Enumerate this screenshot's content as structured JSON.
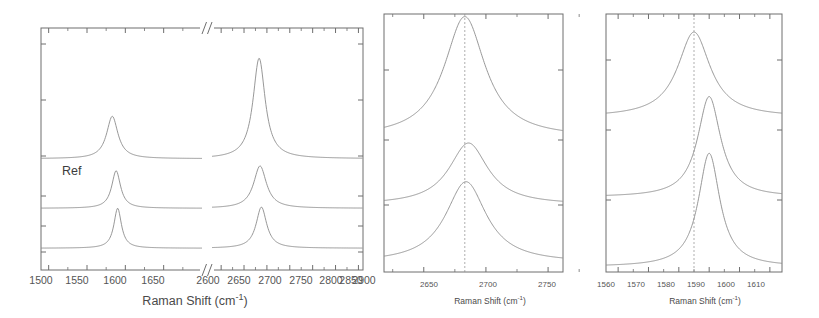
{
  "figure": {
    "background_color": "#ffffff",
    "curve_color": "#8c8c8c",
    "axis_color": "#6e6e6e",
    "text_color": "#4a4a4a",
    "panel_count": 3
  },
  "chart_data": [
    {
      "id": "panel-a",
      "type": "line",
      "title": "",
      "xlabel": "Raman Shift (cm-1)",
      "xlabel_base": "Raman Shift (cm",
      "xlabel_sup": "-1",
      "xlabel_close": ")",
      "ylabel": "",
      "grid": false,
      "legend": "none",
      "axis_break": true,
      "axis_break_symbol": "//",
      "axis_break_position": 2000,
      "xticks": [
        1500,
        1550,
        1600,
        1650,
        2600,
        2650,
        2700,
        2750,
        2800,
        2850,
        2900
      ],
      "xtick_labels": [
        "1500",
        "1550",
        "1600",
        "1650",
        "2600",
        "2650",
        "2700",
        "2750",
        "2800",
        "2850",
        "2900"
      ],
      "xlim_left": [
        1490,
        1700
      ],
      "xlim_right": [
        2580,
        2910
      ],
      "ylim": [
        0,
        1
      ],
      "yticks_visible": true,
      "annotations": [
        {
          "text": "Ref",
          "x": 1545,
          "y": 0.455,
          "name": "ref-label"
        }
      ],
      "series": [
        {
          "name": "Ref (top trace)",
          "offset": 0.46,
          "peaks": [
            {
              "center": 1583,
              "height": 0.175,
              "width": 9,
              "band": "G"
            },
            {
              "center": 2683,
              "height": 0.415,
              "width": 16,
              "band": "2D"
            }
          ]
        },
        {
          "name": "middle trace",
          "offset": 0.255,
          "peaks": [
            {
              "center": 1588,
              "height": 0.155,
              "width": 7,
              "band": "G"
            },
            {
              "center": 2685,
              "height": 0.175,
              "width": 17,
              "band": "2D"
            }
          ]
        },
        {
          "name": "bottom trace",
          "offset": 0.09,
          "peaks": [
            {
              "center": 1590,
              "height": 0.165,
              "width": 6,
              "band": "G"
            },
            {
              "center": 2688,
              "height": 0.17,
              "width": 14,
              "band": "2D"
            }
          ]
        }
      ]
    },
    {
      "id": "panel-b",
      "type": "line",
      "title": "",
      "xlabel": "Raman Shift (cm-1)",
      "xlabel_base": "Raman Shift (cm",
      "xlabel_sup": "-1",
      "xlabel_close": ")",
      "ylabel": "",
      "grid": false,
      "legend": "none",
      "xticks": [
        2650,
        2700,
        2750
      ],
      "xtick_labels": [
        "2650",
        "2700",
        "2750"
      ],
      "xlim": [
        2618,
        2762
      ],
      "ylim": [
        0,
        1
      ],
      "reference_line": {
        "x": 2683,
        "style": "dashed",
        "name": "reference-line-2d"
      },
      "series": [
        {
          "name": "top trace",
          "offset": 0.52,
          "peaks": [
            {
              "center": 2683,
              "height": 0.47,
              "width": 20,
              "band": "2D"
            }
          ]
        },
        {
          "name": "middle trace",
          "offset": 0.26,
          "peaks": [
            {
              "center": 2686,
              "height": 0.24,
              "width": 19,
              "band": "2D"
            }
          ]
        },
        {
          "name": "bottom trace",
          "offset": 0.035,
          "peaks": [
            {
              "center": 2684,
              "height": 0.315,
              "width": 20,
              "band": "2D"
            }
          ]
        }
      ]
    },
    {
      "id": "panel-c",
      "type": "line",
      "title": "",
      "xlabel": "Raman Shift (cm-1)",
      "xlabel_base": "Raman Shift (cm",
      "xlabel_sup": "-1",
      "xlabel_close": ")",
      "ylabel": "",
      "grid": false,
      "legend": "none",
      "xticks": [
        1560,
        1570,
        1580,
        1590,
        1600,
        1610
      ],
      "xtick_labels": [
        "1560",
        "1570",
        "1580",
        "1590",
        "1600",
        "1610"
      ],
      "xlim": [
        1556,
        1614
      ],
      "ylim": [
        0,
        1
      ],
      "reference_line": {
        "x": 1585,
        "style": "dashed",
        "name": "reference-line-g"
      },
      "series": [
        {
          "name": "top trace",
          "offset": 0.6,
          "peaks": [
            {
              "center": 1585,
              "height": 0.33,
              "width": 6.5,
              "band": "G"
            }
          ]
        },
        {
          "name": "middle trace",
          "offset": 0.29,
          "peaks": [
            {
              "center": 1590,
              "height": 0.39,
              "width": 4.6,
              "band": "G"
            }
          ]
        },
        {
          "name": "bottom trace",
          "offset": 0.02,
          "peaks": [
            {
              "center": 1590,
              "height": 0.44,
              "width": 4.3,
              "band": "G"
            }
          ]
        }
      ]
    }
  ]
}
